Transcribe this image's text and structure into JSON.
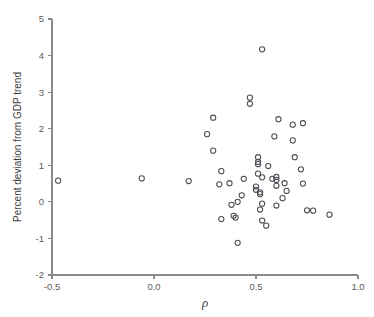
{
  "chart_data": {
    "type": "scatter",
    "title": "",
    "xlabel": "ρ",
    "ylabel": "Percent deviation from GDP trend",
    "xlim": [
      -0.5,
      1.0
    ],
    "ylim": [
      -2,
      5
    ],
    "xticks": [
      -0.5,
      0.0,
      0.5,
      1.0
    ],
    "xticklabels": [
      "-0.5",
      "0.0",
      "0.5",
      "1.0"
    ],
    "yticks": [
      -2,
      -1,
      0,
      1,
      2,
      3,
      4,
      5
    ],
    "yticklabels": [
      "-2",
      "-1",
      "0",
      "1",
      "2",
      "3",
      "4",
      "5"
    ],
    "grid": false,
    "legend": null,
    "marker": "open-circle",
    "marker_color": "#4d4d55",
    "points": [
      {
        "x": -0.47,
        "y": 0.58
      },
      {
        "x": -0.06,
        "y": 0.64
      },
      {
        "x": 0.17,
        "y": 0.57
      },
      {
        "x": 0.26,
        "y": 1.85
      },
      {
        "x": 0.29,
        "y": 2.3
      },
      {
        "x": 0.29,
        "y": 1.4
      },
      {
        "x": 0.32,
        "y": 0.48
      },
      {
        "x": 0.33,
        "y": 0.84
      },
      {
        "x": 0.33,
        "y": -0.47
      },
      {
        "x": 0.37,
        "y": 0.51
      },
      {
        "x": 0.38,
        "y": -0.08
      },
      {
        "x": 0.39,
        "y": -0.38
      },
      {
        "x": 0.4,
        "y": -0.43
      },
      {
        "x": 0.41,
        "y": 0.0
      },
      {
        "x": 0.41,
        "y": -1.12
      },
      {
        "x": 0.43,
        "y": 0.18
      },
      {
        "x": 0.44,
        "y": 0.63
      },
      {
        "x": 0.47,
        "y": 2.85
      },
      {
        "x": 0.47,
        "y": 2.68
      },
      {
        "x": 0.5,
        "y": 0.42
      },
      {
        "x": 0.5,
        "y": 0.33
      },
      {
        "x": 0.51,
        "y": 1.22
      },
      {
        "x": 0.51,
        "y": 1.09
      },
      {
        "x": 0.51,
        "y": 1.03
      },
      {
        "x": 0.51,
        "y": 0.77
      },
      {
        "x": 0.52,
        "y": 0.26
      },
      {
        "x": 0.52,
        "y": 0.21
      },
      {
        "x": 0.52,
        "y": -0.21
      },
      {
        "x": 0.53,
        "y": 4.17
      },
      {
        "x": 0.53,
        "y": 0.67
      },
      {
        "x": 0.53,
        "y": -0.05
      },
      {
        "x": 0.53,
        "y": -0.51
      },
      {
        "x": 0.55,
        "y": -0.65
      },
      {
        "x": 0.56,
        "y": 0.98
      },
      {
        "x": 0.58,
        "y": 0.63
      },
      {
        "x": 0.59,
        "y": 1.79
      },
      {
        "x": 0.6,
        "y": 0.68
      },
      {
        "x": 0.6,
        "y": 0.6
      },
      {
        "x": 0.6,
        "y": 0.44
      },
      {
        "x": 0.6,
        "y": -0.1
      },
      {
        "x": 0.61,
        "y": 2.26
      },
      {
        "x": 0.63,
        "y": 0.1
      },
      {
        "x": 0.64,
        "y": 0.51
      },
      {
        "x": 0.65,
        "y": 0.3
      },
      {
        "x": 0.68,
        "y": 2.11
      },
      {
        "x": 0.68,
        "y": 1.68
      },
      {
        "x": 0.69,
        "y": 1.22
      },
      {
        "x": 0.72,
        "y": 0.89
      },
      {
        "x": 0.73,
        "y": 2.15
      },
      {
        "x": 0.73,
        "y": 0.5
      },
      {
        "x": 0.75,
        "y": -0.23
      },
      {
        "x": 0.78,
        "y": -0.24
      },
      {
        "x": 0.86,
        "y": -0.35
      }
    ]
  }
}
